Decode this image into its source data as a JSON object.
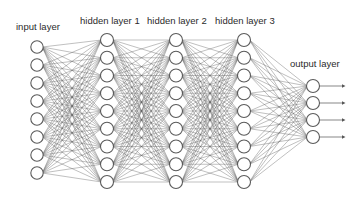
{
  "diagram": {
    "colors": {
      "background": "#ffffff",
      "node_fill": "#ffffff",
      "node_stroke": "#5a5a5a",
      "edge": "#555555",
      "label": "#2b2b2b"
    },
    "layers": [
      {
        "id": "input",
        "label": "input layer",
        "label_pos": [
          16,
          30
        ],
        "x": 37,
        "y_start": 47,
        "spacing": 18,
        "count": 8,
        "radius": 6.2
      },
      {
        "id": "hidden1",
        "label": "hidden layer 1",
        "label_pos": [
          80,
          24
        ],
        "x": 107,
        "y_start": 40,
        "spacing": 17.75,
        "count": 9,
        "radius": 6.5
      },
      {
        "id": "hidden2",
        "label": "hidden layer 2",
        "label_pos": [
          147,
          24
        ],
        "x": 176,
        "y_start": 40,
        "spacing": 17.75,
        "count": 9,
        "radius": 6.5
      },
      {
        "id": "hidden3",
        "label": "hidden layer 3",
        "label_pos": [
          215,
          24
        ],
        "x": 244,
        "y_start": 40,
        "spacing": 17.75,
        "count": 9,
        "radius": 6.5
      },
      {
        "id": "output",
        "label": "output layer",
        "label_pos": [
          290,
          67
        ],
        "x": 313,
        "y_start": 86,
        "spacing": 17,
        "count": 4,
        "radius": 6.5
      }
    ],
    "output_arrows": {
      "length": 26,
      "head_size": 2.2
    },
    "labels": {
      "input": "input layer",
      "hidden1": "hidden layer 1",
      "hidden2": "hidden layer 2",
      "hidden3": "hidden layer 3",
      "output": "output layer"
    }
  }
}
